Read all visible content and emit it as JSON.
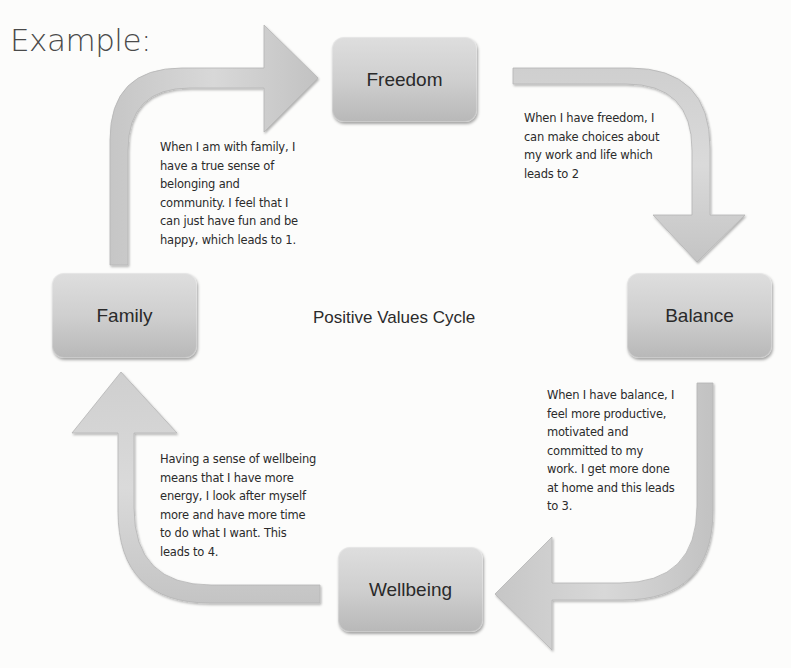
{
  "heading": "Example:",
  "diagram": {
    "title": "Positive Values Cycle",
    "colors": {
      "node_fill_top": "#dedede",
      "node_fill_bottom": "#b8b8b8",
      "arrow_fill": "#d2d2d2",
      "text": "#2b2b2b"
    },
    "nodes": [
      {
        "id": "freedom",
        "label": "Freedom"
      },
      {
        "id": "balance",
        "label": "Balance"
      },
      {
        "id": "wellbeing",
        "label": "Wellbeing"
      },
      {
        "id": "family",
        "label": "Family"
      }
    ],
    "descriptions": {
      "family_to_freedom": [
        "When I am with family, I",
        "have a true sense of",
        "belonging and",
        "community. I feel that I",
        "can just have fun and be",
        "happy, which leads to 1."
      ],
      "freedom_to_balance": [
        "When I have freedom, I",
        "can make choices about",
        "my work and life which",
        "leads to 2"
      ],
      "balance_to_wellbeing": [
        "When I have balance, I",
        "feel more productive,",
        "motivated and",
        "committed to my",
        "work. I get more done",
        "at home and this leads",
        "to 3."
      ],
      "wellbeing_to_family": [
        "Having a sense of wellbeing",
        "means that I have more",
        "energy, I look after myself",
        "more and have more time",
        "to do what I want. This",
        "leads to 4."
      ]
    },
    "arrows": [
      {
        "from": "Family",
        "to": "Freedom",
        "direction": "up-then-right"
      },
      {
        "from": "Freedom",
        "to": "Balance",
        "direction": "right-then-down"
      },
      {
        "from": "Balance",
        "to": "Wellbeing",
        "direction": "down-then-left"
      },
      {
        "from": "Wellbeing",
        "to": "Family",
        "direction": "left-then-up"
      }
    ]
  }
}
